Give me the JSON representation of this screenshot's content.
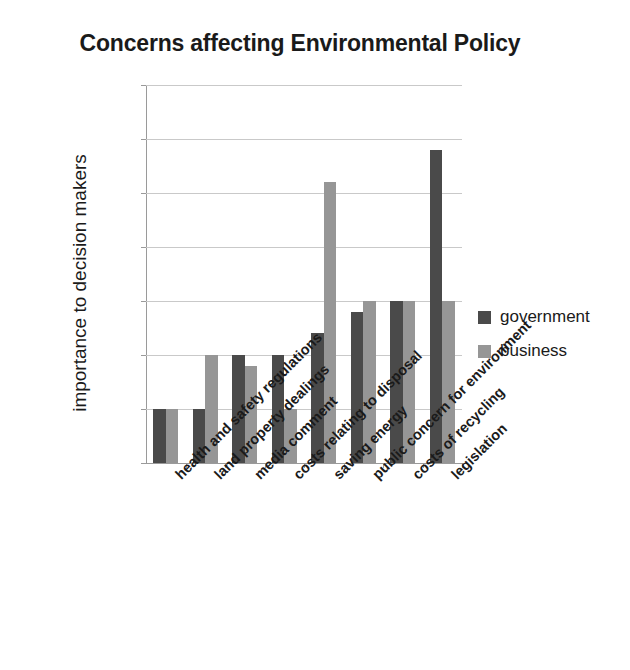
{
  "chart_data": {
    "type": "bar",
    "title": "Concerns affecting Environmental Policy",
    "xlabel": "",
    "ylabel": "importance to decision makers",
    "ylim": [
      0,
      35
    ],
    "ytick_labels": [
      "35%",
      "30%",
      "25%",
      "20%",
      "15%",
      "10%",
      "5%",
      "0%"
    ],
    "ytick_values": [
      35,
      30,
      25,
      20,
      15,
      10,
      5,
      0
    ],
    "grid": true,
    "legend_position": "right",
    "categories": [
      "health and safety regulations",
      "land property dealings",
      "media comment",
      "costs relating to disposal",
      "saving energy",
      "public concern for environment",
      "costs of recycling",
      "legislation"
    ],
    "series": [
      {
        "name": "government",
        "color": "#4a4a4a",
        "values": [
          5,
          5,
          10,
          10,
          12,
          14,
          15,
          29
        ]
      },
      {
        "name": "business",
        "color": "#969696",
        "values": [
          5,
          10,
          9,
          5,
          26,
          15,
          15,
          15
        ]
      }
    ]
  },
  "legend": {
    "items": [
      {
        "label": "government",
        "color": "#4a4a4a"
      },
      {
        "label": "business",
        "color": "#969696"
      }
    ]
  }
}
